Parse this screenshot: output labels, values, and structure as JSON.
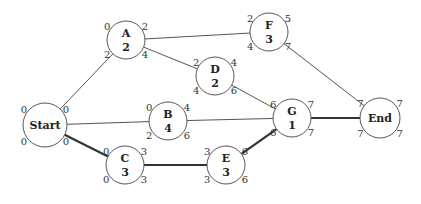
{
  "diagram": {
    "type": "activity-network-critical-path",
    "nodes": [
      {
        "id": "start",
        "name": "Start",
        "duration": "",
        "cx": 45,
        "cy": 125,
        "r": 22,
        "labels": {
          "es": "0",
          "ef": "0",
          "ls": "0",
          "lf": "0"
        }
      },
      {
        "id": "a",
        "name": "A",
        "duration": "2",
        "cx": 126,
        "cy": 40,
        "r": 19,
        "labels": {
          "es": "0",
          "ef": "2",
          "ls": "2",
          "lf": "4"
        }
      },
      {
        "id": "b",
        "name": "B",
        "duration": "4",
        "cx": 168,
        "cy": 121,
        "r": 19,
        "labels": {
          "es": "0",
          "ef": "4",
          "ls": "2",
          "lf": "6"
        }
      },
      {
        "id": "c",
        "name": "C",
        "duration": "3",
        "cx": 125,
        "cy": 165,
        "r": 19,
        "labels": {
          "es": "0",
          "ef": "3",
          "ls": "0",
          "lf": "3"
        }
      },
      {
        "id": "d",
        "name": "D",
        "duration": "2",
        "cx": 215,
        "cy": 76,
        "r": 19,
        "labels": {
          "es": "2",
          "ef": "4",
          "ls": "4",
          "lf": "6"
        }
      },
      {
        "id": "e",
        "name": "E",
        "duration": "3",
        "cx": 226,
        "cy": 165,
        "r": 19,
        "labels": {
          "es": "3",
          "ef": "6",
          "ls": "3",
          "lf": "6"
        }
      },
      {
        "id": "f",
        "name": "F",
        "duration": "3",
        "cx": 269,
        "cy": 32,
        "r": 19,
        "labels": {
          "es": "2",
          "ef": "5",
          "ls": "4",
          "lf": "7"
        }
      },
      {
        "id": "g",
        "name": "G",
        "duration": "1",
        "cx": 292,
        "cy": 118,
        "r": 19,
        "labels": {
          "es": "6",
          "ef": "7",
          "ls": "6",
          "lf": "7"
        }
      },
      {
        "id": "end",
        "name": "End",
        "duration": "",
        "cx": 380,
        "cy": 118,
        "r": 20,
        "labels": {
          "es": "7",
          "ef": "7",
          "ls": "7",
          "lf": "7"
        }
      }
    ],
    "edges": [
      {
        "from": "start",
        "to": "a",
        "critical": false
      },
      {
        "from": "start",
        "to": "b",
        "critical": false
      },
      {
        "from": "start",
        "to": "c",
        "critical": true
      },
      {
        "from": "a",
        "to": "f",
        "critical": false
      },
      {
        "from": "a",
        "to": "d",
        "critical": false
      },
      {
        "from": "d",
        "to": "g",
        "critical": false
      },
      {
        "from": "b",
        "to": "g",
        "critical": false
      },
      {
        "from": "c",
        "to": "e",
        "critical": true
      },
      {
        "from": "e",
        "to": "g",
        "critical": true
      },
      {
        "from": "f",
        "to": "end",
        "critical": false
      },
      {
        "from": "g",
        "to": "end",
        "critical": true
      }
    ],
    "colors": {
      "line": "#555555",
      "critical_line": "#333333",
      "text": "#222222",
      "background": "#ffffff"
    }
  }
}
